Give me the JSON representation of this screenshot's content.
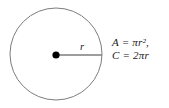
{
  "figure": {
    "type": "geometry-diagram",
    "background_color": "#ffffff",
    "width": 169,
    "height": 108
  },
  "circle": {
    "name": "circle-outline",
    "center_x": 56,
    "center_y": 54,
    "radius": 46,
    "stroke_color": "#7d7d7d",
    "stroke_width": 1,
    "fill_color": "#ffffff"
  },
  "center_point": {
    "name": "center-dot",
    "x": 56,
    "y": 55,
    "radius": 3.6,
    "color": "#000000"
  },
  "radius_segment": {
    "name": "radius-line",
    "x1": 56,
    "y1": 55,
    "x2": 102,
    "y2": 55,
    "stroke_color": "#7d7d7d",
    "stroke_width": 1.6,
    "label": "r"
  },
  "formulas": {
    "lines": [
      "A = πr²,",
      "C = 2πr"
    ],
    "area_formula": "A = πr²,",
    "circumference_formula": "C = 2πr",
    "text_color": "#1a1a1a"
  }
}
